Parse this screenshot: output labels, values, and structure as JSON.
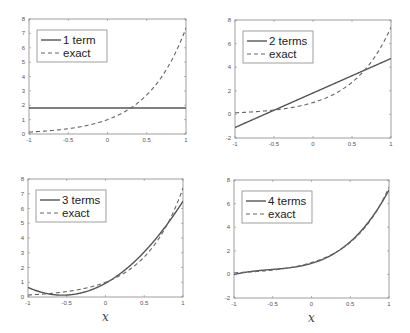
{
  "chart_data": [
    {
      "type": "line",
      "title": "",
      "xlabel": "",
      "ylabel": "",
      "xlim": [
        -1,
        1
      ],
      "ylim": [
        0,
        8
      ],
      "xticks": [
        "-1",
        "-0.5",
        "0",
        "0.5",
        "1"
      ],
      "yticks": [
        "0",
        "1",
        "2",
        "3",
        "4",
        "5",
        "6",
        "7",
        "8"
      ],
      "legend_position": "top-left",
      "grid": false,
      "series": [
        {
          "name": "1 term",
          "style": "solid",
          "terms": 1
        },
        {
          "name": "exact",
          "style": "dashed",
          "function": "exp(2x)"
        }
      ]
    },
    {
      "type": "line",
      "title": "",
      "xlabel": "",
      "ylabel": "",
      "xlim": [
        -1,
        1
      ],
      "ylim": [
        -2,
        8
      ],
      "xticks": [
        "-1",
        "-0.5",
        "0",
        "0.5",
        "1"
      ],
      "yticks": [
        "-2",
        "0",
        "2",
        "4",
        "6",
        "8"
      ],
      "legend_position": "top-left",
      "grid": false,
      "series": [
        {
          "name": "2 terms",
          "style": "solid",
          "terms": 2
        },
        {
          "name": "exact",
          "style": "dashed",
          "function": "exp(2x)"
        }
      ]
    },
    {
      "type": "line",
      "title": "",
      "xlabel": "x",
      "ylabel": "",
      "xlim": [
        -1,
        1
      ],
      "ylim": [
        0,
        8
      ],
      "xticks": [
        "-1",
        "-0.5",
        "0",
        "0.5",
        "1"
      ],
      "yticks": [
        "0",
        "1",
        "2",
        "3",
        "4",
        "5",
        "6",
        "7",
        "8"
      ],
      "legend_position": "top-left",
      "grid": false,
      "series": [
        {
          "name": "3 terms",
          "style": "solid",
          "terms": 3
        },
        {
          "name": "exact",
          "style": "dashed",
          "function": "exp(2x)"
        }
      ]
    },
    {
      "type": "line",
      "title": "",
      "xlabel": "x",
      "ylabel": "",
      "xlim": [
        -1,
        1
      ],
      "ylim": [
        -2,
        8
      ],
      "xticks": [
        "-1",
        "-0.5",
        "0",
        "0.5",
        "1"
      ],
      "yticks": [
        "-2",
        "0",
        "2",
        "4",
        "6",
        "8"
      ],
      "legend_position": "top-left",
      "grid": false,
      "series": [
        {
          "name": "4 terms",
          "style": "solid",
          "terms": 4
        },
        {
          "name": "exact",
          "style": "dashed",
          "function": "exp(2x)"
        }
      ]
    }
  ],
  "colors": {
    "approx": "#555555",
    "exact": "#666666",
    "axes": "#888888"
  }
}
